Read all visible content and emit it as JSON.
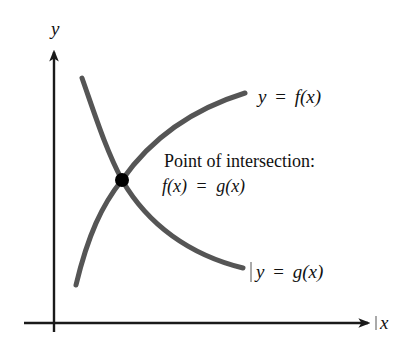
{
  "diagram": {
    "axes": {
      "x_label": "x",
      "y_label": "y",
      "color": "#1a1a1a"
    },
    "curves": [
      {
        "id": "f",
        "label": "y = f(x)",
        "label_parts": {
          "var": "y",
          "eq": "=",
          "func": "f(x)"
        },
        "shape": "increasing, concave down",
        "color": "#555555"
      },
      {
        "id": "g",
        "label": "y = g(x)",
        "label_parts": {
          "var": "y",
          "eq": "=",
          "func": "g(x)"
        },
        "shape": "decreasing, concave up",
        "color": "#555555"
      }
    ],
    "intersection": {
      "title": "Point of intersection:",
      "equation": "f(x) = g(x)",
      "equation_parts": {
        "left": "f(x)",
        "eq": "=",
        "right": "g(x)"
      },
      "marker_color": "#000000"
    }
  }
}
